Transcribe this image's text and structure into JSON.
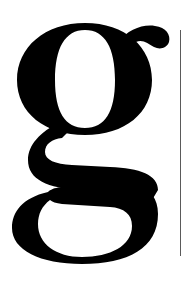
{
  "glyph": {
    "character": "g",
    "style": "serif lowercase, double-story",
    "color": "#000000"
  },
  "background": "#ffffff",
  "rule": {
    "color": "#5a5a5a",
    "orientation": "vertical"
  }
}
